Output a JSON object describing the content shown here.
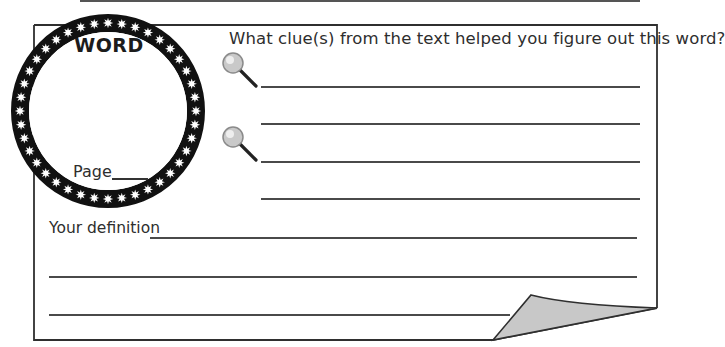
{
  "worksheet": {
    "word_box": {
      "label": "WORD",
      "page_label": "Page",
      "page_value": ""
    },
    "clues": {
      "question": "What clue(s) from the text helped you figure out this word?",
      "icon": "magnifying-glass-icon",
      "groups": [
        {
          "lines": [
            "",
            ""
          ]
        },
        {
          "lines": [
            "",
            ""
          ]
        }
      ]
    },
    "definition": {
      "label": "Your definition",
      "lines": [
        "",
        "",
        ""
      ]
    },
    "decoration": {
      "ring_color": "#111111",
      "star_color": "#ffffff",
      "curl_fill": "#c8c8c8",
      "border_color": "#333333"
    }
  }
}
